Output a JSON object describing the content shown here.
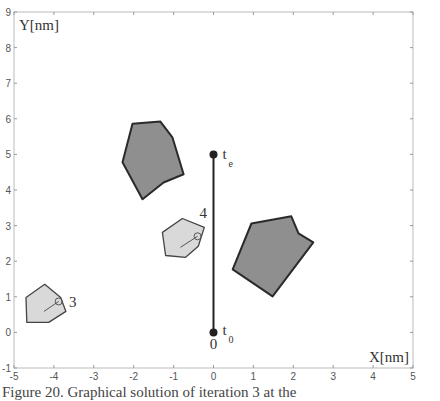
{
  "chart_data": {
    "type": "scatter",
    "title": "",
    "xlabel": "X[nm]",
    "ylabel": "Y[nm]",
    "xlim": [
      -5,
      5
    ],
    "ylim": [
      -1,
      9
    ],
    "xticks": [
      -5,
      -4,
      -3,
      -2,
      -1,
      0,
      1,
      2,
      3,
      4,
      5
    ],
    "yticks": [
      -1,
      0,
      1,
      2,
      3,
      4,
      5,
      6,
      7,
      8,
      9
    ],
    "grid": false,
    "obstacles_dark": [
      {
        "name": "obstacle-upper-left",
        "vertices": [
          [
            -2.03,
            5.86
          ],
          [
            -1.33,
            5.92
          ],
          [
            -1.03,
            5.48
          ],
          [
            -0.75,
            4.44
          ],
          [
            -1.25,
            4.21
          ],
          [
            -1.78,
            3.74
          ],
          [
            -2.28,
            4.78
          ]
        ]
      },
      {
        "name": "obstacle-right",
        "vertices": [
          [
            0.95,
            3.06
          ],
          [
            1.95,
            3.26
          ],
          [
            2.13,
            2.78
          ],
          [
            2.5,
            2.53
          ],
          [
            1.48,
            1.01
          ],
          [
            0.48,
            1.77
          ]
        ]
      }
    ],
    "robots": [
      {
        "label": "3",
        "vertices": [
          [
            -4.7,
            0.98
          ],
          [
            -4.23,
            1.35
          ],
          [
            -3.83,
            0.98
          ],
          [
            -3.7,
            0.59
          ],
          [
            -4.13,
            0.28
          ],
          [
            -4.68,
            0.28
          ]
        ],
        "center": [
          -3.88,
          0.87
        ],
        "line_from": [
          -4.25,
          0.59
        ]
      },
      {
        "label": "4",
        "vertices": [
          [
            -1.28,
            2.81
          ],
          [
            -0.78,
            3.2
          ],
          [
            -0.23,
            2.95
          ],
          [
            -0.38,
            2.42
          ],
          [
            -0.7,
            2.11
          ],
          [
            -1.2,
            2.16
          ]
        ],
        "center": [
          -0.4,
          2.7
        ],
        "line_from": [
          -0.83,
          2.39
        ]
      }
    ],
    "trajectory": {
      "start": [
        0,
        0
      ],
      "end": [
        0,
        5
      ],
      "start_label": "t",
      "start_sub": "0",
      "end_label": "t",
      "end_sub": "e",
      "origin_label": "0"
    }
  },
  "caption": "Figure 20. Graphical solution of iteration 3 at the"
}
